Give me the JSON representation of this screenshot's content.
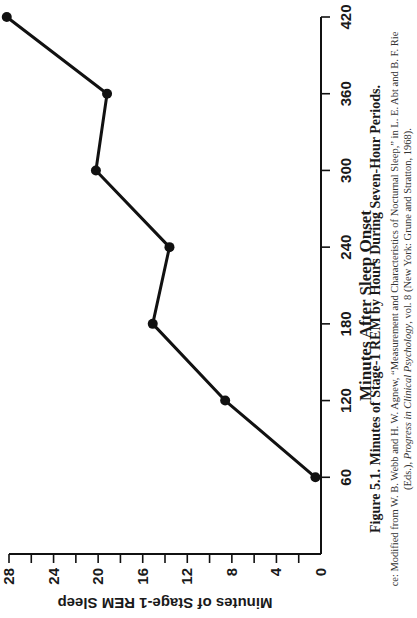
{
  "chart_data": {
    "type": "line",
    "title": "Figure 5.1. Minutes of Stage-1 REM by Hours During Seven-Hour Periods.",
    "xlabel": "Minutes After Sleep Onset",
    "ylabel": "Minutes of Stage-1 REM Sleep",
    "x": [
      60,
      120,
      180,
      240,
      300,
      360,
      420
    ],
    "values": [
      0.5,
      8.6,
      15.1,
      13.6,
      20.2,
      19.2,
      28.2
    ],
    "xlim": [
      0,
      420
    ],
    "ylim": [
      0,
      28
    ],
    "x_ticks": [
      "0",
      "60",
      "120",
      "180",
      "240",
      "300",
      "360",
      "420"
    ],
    "y_ticks": [
      "4",
      "8",
      "12",
      "16",
      "20",
      "24",
      "28"
    ],
    "y_minor_step": 2,
    "grid": false,
    "legend": null,
    "orientation": "rotated 90 degrees counter-clockwise on page",
    "marker": "filled circle",
    "line_color": "#111111"
  },
  "caption": {
    "title": "Figure 5.1. Minutes of Stage-1 REM by Hours During Seven-Hour Periods.",
    "source_line1": "ce: Modified from W. B. Webb and H. W. Agnew, “Measurement and Characteristics of Nocturnal Sleep,” in L. E. Abt and B. F. Rie",
    "source_line2_pre": "(Eds.), ",
    "source_line2_italic": "Progress in Clinical Psychology",
    "source_line2_post": ", vol. 8 (New York: Grune and Stratton, 1968)."
  }
}
